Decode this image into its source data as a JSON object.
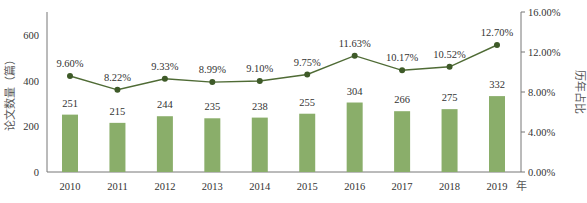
{
  "chart_data": {
    "type": "bar+line",
    "title": "",
    "categories": [
      "2010",
      "2011",
      "2012",
      "2013",
      "2014",
      "2015",
      "2016",
      "2017",
      "2018",
      "2019"
    ],
    "series": [
      {
        "name": "论文数量（篇）",
        "type": "bar",
        "axis": "left",
        "color": "#8aae6a",
        "values": [
          251,
          215,
          244,
          235,
          238,
          255,
          304,
          266,
          275,
          332
        ],
        "labels": [
          "251",
          "215",
          "244",
          "235",
          "238",
          "255",
          "304",
          "266",
          "275",
          "332"
        ]
      },
      {
        "name": "历年占比",
        "type": "line",
        "axis": "right",
        "color": "#4f6b35",
        "values": [
          9.6,
          8.22,
          9.33,
          8.99,
          9.1,
          9.75,
          11.63,
          10.17,
          10.52,
          12.7
        ],
        "labels": [
          "9.60%",
          "8.22%",
          "9.33%",
          "8.99%",
          "9.10%",
          "9.75%",
          "11.63%",
          "10.17%",
          "10.52%",
          "12.70%"
        ]
      }
    ],
    "xlabel": "年",
    "ylabel": "论文数量（篇）",
    "y2label": "历年占比",
    "ylim": [
      0,
      700
    ],
    "y2lim": [
      0,
      16
    ],
    "yticks": [
      "0",
      "200",
      "400",
      "600"
    ],
    "y2ticks": [
      "0.00%",
      "4.00%",
      "8.00%",
      "12.00%",
      "16.00%"
    ],
    "grid": false,
    "legend": "none"
  }
}
